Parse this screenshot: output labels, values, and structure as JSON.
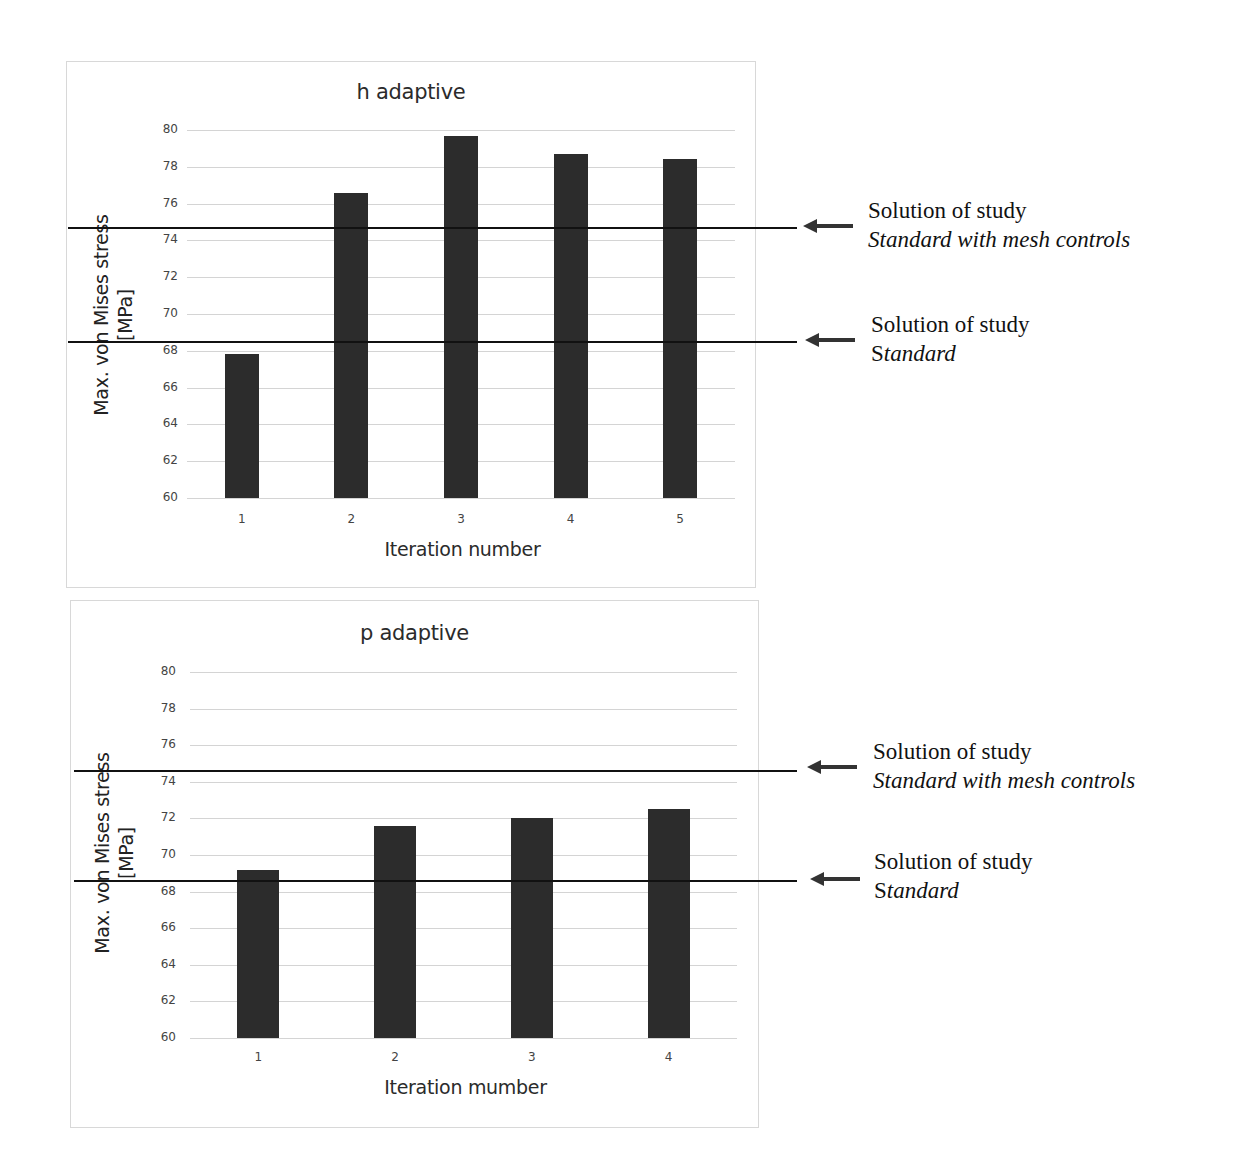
{
  "charts": [
    {
      "id": "h-adaptive",
      "title": "h adaptive",
      "ylabel_line1": "Max. von Mises stress",
      "ylabel_line2": "[MPa]",
      "xlabel": "Iteration number",
      "yticks": [
        "80",
        "78",
        "76",
        "74",
        "72",
        "70",
        "68",
        "66",
        "64",
        "62",
        "60"
      ],
      "xticks": [
        "1",
        "2",
        "3",
        "4",
        "5"
      ],
      "annotations": [
        {
          "line1": "Solution of study",
          "line2_upright": "",
          "line2_italic": "Standard with mesh controls"
        },
        {
          "line1": "Solution of study",
          "line2_upright": "S",
          "line2_italic": "tandard"
        }
      ]
    },
    {
      "id": "p-adaptive",
      "title": "p adaptive",
      "ylabel_line1": "Max. von Mises stress",
      "ylabel_line2": "[MPa]",
      "xlabel": "Iteration mumber",
      "yticks": [
        "80",
        "78",
        "76",
        "74",
        "72",
        "70",
        "68",
        "66",
        "64",
        "62",
        "60"
      ],
      "xticks": [
        "1",
        "2",
        "3",
        "4"
      ],
      "annotations": [
        {
          "line1": "Solution of study",
          "line2_upright": "",
          "line2_italic": "Standard with mesh controls"
        },
        {
          "line1": "Solution of study",
          "line2_upright": "S",
          "line2_italic": "tandard"
        }
      ]
    }
  ],
  "colors": {
    "bar": "#2c2c2c",
    "refline": "#111111",
    "grid": "#d4d4d4",
    "frame": "#d8d8d8"
  },
  "chart_data": [
    {
      "type": "bar",
      "title": "h adaptive",
      "xlabel": "Iteration number",
      "ylabel": "Max. von Mises stress [MPa]",
      "categories": [
        "1",
        "2",
        "3",
        "4",
        "5"
      ],
      "values": [
        67.8,
        76.6,
        79.7,
        78.7,
        78.4
      ],
      "ylim": [
        60,
        80
      ],
      "ytick_step": 2,
      "grid": true,
      "reference_lines": [
        {
          "value": 74.7,
          "label": "Solution of study Standard with mesh controls"
        },
        {
          "value": 68.5,
          "label": "Solution of study Standard"
        }
      ]
    },
    {
      "type": "bar",
      "title": "p adaptive",
      "xlabel": "Iteration mumber",
      "ylabel": "Max. von Mises stress [MPa]",
      "categories": [
        "1",
        "2",
        "3",
        "4"
      ],
      "values": [
        69.2,
        71.6,
        72.0,
        72.5
      ],
      "ylim": [
        60,
        80
      ],
      "ytick_step": 2,
      "grid": true,
      "reference_lines": [
        {
          "value": 74.6,
          "label": "Solution of study Standard with mesh controls"
        },
        {
          "value": 68.6,
          "label": "Solution of study Standard"
        }
      ]
    }
  ]
}
